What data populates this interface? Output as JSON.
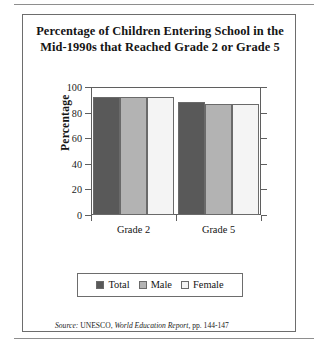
{
  "figure": {
    "title_line1": "Percentage of Children Entering School in the",
    "title_line2": "Mid-1990s that Reached Grade 2 or Grade 5",
    "source_prefix": "Source:",
    "source_org": "UNESCO,",
    "source_publication": "World Education Report,",
    "source_pages": "pp. 144-147"
  },
  "colors": {
    "total": "#595959",
    "male": "#b3b3b3",
    "female": "#f4f4f4",
    "outline": "#6a6a6a",
    "frame": "#5f5f5f"
  },
  "chart_data": {
    "type": "bar",
    "title": "Percentage of Children Entering School in the Mid-1990s that Reached Grade 2 or Grade 5",
    "xlabel": "",
    "ylabel": "Percentage",
    "categories": [
      "Grade 2",
      "Grade 5"
    ],
    "series": [
      {
        "name": "Total",
        "values": [
          92,
          88
        ]
      },
      {
        "name": "Male",
        "values": [
          92,
          87
        ]
      },
      {
        "name": "Female",
        "values": [
          92,
          87
        ]
      }
    ],
    "ylim": [
      0,
      100
    ],
    "yticks": [
      0,
      20,
      40,
      60,
      80,
      100
    ],
    "ytick_labels": [
      "0",
      "20",
      "40",
      "60",
      "80",
      "100"
    ],
    "grid": false,
    "legend_position": "bottom"
  }
}
